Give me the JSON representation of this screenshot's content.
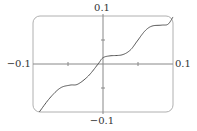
{
  "chart_data": {
    "type": "line",
    "title": "",
    "xlabel": "",
    "ylabel": "",
    "xlim": [
      -0.1,
      0.1
    ],
    "ylim": [
      -0.1,
      0.1
    ],
    "grid": false,
    "legend": null,
    "tick_labels": {
      "x_min": "−0.1",
      "x_max": "0.1",
      "y_min": "−0.1",
      "y_max": "0.1"
    },
    "x_ticks": [
      -0.05,
      0.05
    ],
    "y_ticks": [
      -0.05,
      0.05
    ],
    "series": [
      {
        "name": "f(x)",
        "color": "#555555",
        "x": [
          -0.091,
          -0.076,
          -0.061,
          -0.047,
          -0.036,
          -0.021,
          -0.007,
          0.0,
          0.01,
          0.027,
          0.039,
          0.049,
          0.06,
          0.07,
          0.084,
          0.093,
          0.1
        ],
        "y": [
          -0.1,
          -0.071,
          -0.05,
          -0.044,
          -0.042,
          -0.025,
          0.0,
          0.013,
          0.017,
          0.019,
          0.029,
          0.048,
          0.069,
          0.079,
          0.081,
          0.083,
          0.098
        ]
      }
    ]
  },
  "frame": {
    "color": "#b0b0b0",
    "corner_radius": 7
  },
  "axes": {
    "color": "#888888"
  }
}
